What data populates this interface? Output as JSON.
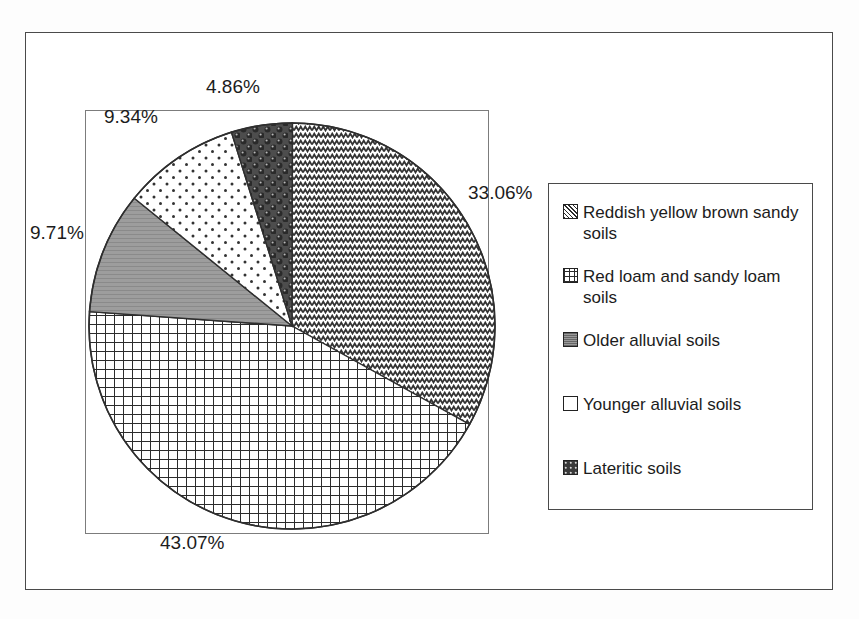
{
  "chart_data": {
    "type": "pie",
    "title": "",
    "subtitle": "",
    "xlabel": "",
    "ylabel": "",
    "grid": false,
    "legend_position": "right",
    "value_unit": "percent",
    "categories": [
      "Reddish yellow brown sandy soils",
      "Lateritic soils",
      "Older alluvial soils",
      "Younger alluvial soils",
      "Red loam and sandy loam soils"
    ],
    "values": [
      33.06,
      43.07,
      9.71,
      9.34,
      4.86
    ],
    "slices": [
      {
        "label": "Reddish yellow brown sandy soils",
        "value": 33.06,
        "display": "33.06%",
        "pattern": "zigzag",
        "start_deg": 0,
        "sweep_deg": 119.016
      },
      {
        "label": "Lateritic soils",
        "value": 43.07,
        "display": "43.07%",
        "pattern": "grid",
        "start_deg": 119.016,
        "sweep_deg": 155.052
      },
      {
        "label": "Older alluvial soils",
        "value": 9.71,
        "display": "9.71%",
        "pattern": "gray-solid",
        "start_deg": 274.068,
        "sweep_deg": 34.956
      },
      {
        "label": "Younger alluvial soils",
        "value": 9.34,
        "display": "9.34%",
        "pattern": "dots",
        "start_deg": 309.024,
        "sweep_deg": 33.624
      },
      {
        "label": "Red loam and sandy loam soils",
        "value": 4.86,
        "display": "4.86%",
        "pattern": "spheres-dark",
        "start_deg": 342.648,
        "sweep_deg": 17.496
      }
    ]
  },
  "labels": {
    "top": "4.86%",
    "left_upper": "9.34%",
    "left": "9.71%",
    "right": "33.06%",
    "bottom": "43.07%"
  },
  "legend": {
    "items": [
      {
        "label": "Reddish yellow brown sandy soils",
        "swatch": "zigzag-swatch"
      },
      {
        "label": "Red loam and sandy loam soils",
        "swatch": "grid-swatch"
      },
      {
        "label": "Older alluvial soils",
        "swatch": "gray-swatch"
      },
      {
        "label": "Younger alluvial soils",
        "swatch": "white-swatch"
      },
      {
        "label": "Lateritic soils",
        "swatch": "dark-swatch"
      }
    ]
  },
  "colors": {
    "ink": "#1c1c1c",
    "frame": "#4a4a4a",
    "plot_frame": "#7c7c7c",
    "gray_fill": "#9a9a9a",
    "dark_fill": "#3a3a3a",
    "background": "#ffffff"
  }
}
